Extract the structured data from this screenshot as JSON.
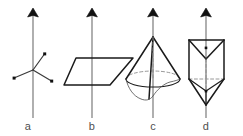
{
  "figure": {
    "width": 243,
    "height": 136,
    "background_color": "#ffffff",
    "axis_color": "#6e6e6e",
    "edge_color": "#1a1a1a",
    "hidden_edge_color": "#8c8c8c",
    "label_color": "#4f4f4f",
    "panels": [
      {
        "id": "a",
        "label": "a",
        "label_x": 28,
        "label_y": 130,
        "object": "trigonal-ligand-center",
        "description": "Vertical axis arrow through a central atom with three radiating bonds ending in dots",
        "axis": {
          "x": 33,
          "tip_y": 9,
          "base_y": 118
        },
        "center": {
          "x": 33,
          "y": 70
        },
        "ligands": [
          {
            "x": 44,
            "y": 54
          },
          {
            "x": 14,
            "y": 78
          },
          {
            "x": 51,
            "y": 81
          }
        ]
      },
      {
        "id": "b",
        "label": "b",
        "label_x": 92,
        "label_y": 130,
        "object": "plane-parallelogram",
        "description": "Vertical axis arrow passing perpendicular through a plane drawn as a parallelogram",
        "axis": {
          "x": 92,
          "tip_y": 9,
          "base_y": 118
        },
        "parallelogram": [
          {
            "x": 76,
            "y": 58
          },
          {
            "x": 133,
            "y": 58
          },
          {
            "x": 110,
            "y": 85
          },
          {
            "x": 64,
            "y": 85
          }
        ]
      },
      {
        "id": "c",
        "label": "c",
        "label_x": 153,
        "label_y": 130,
        "object": "cone",
        "description": "Vertical axis arrow through the apex and base centre of a cone with an irregular drooping rim",
        "axis": {
          "x": 153,
          "tip_y": 9,
          "base_y": 118
        },
        "apex": {
          "x": 153,
          "y": 37
        },
        "base_center": {
          "x": 153,
          "y": 79
        },
        "base_rx": 27,
        "base_ry": 8
      },
      {
        "id": "d",
        "label": "d",
        "label_x": 206,
        "label_y": 130,
        "object": "triangular-prism-bipyramid",
        "description": "Vertical axis arrow through a triangular prism capped with a downward pyramid",
        "axis": {
          "x": 206,
          "tip_y": 9,
          "base_y": 118
        },
        "top_left": {
          "x": 189,
          "y": 40
        },
        "top_right": {
          "x": 224,
          "y": 40
        },
        "front_apex_top": {
          "x": 206,
          "y": 59
        },
        "bottom_left": {
          "x": 189,
          "y": 79
        },
        "bottom_right": {
          "x": 224,
          "y": 79
        },
        "bottom_apex": {
          "x": 206,
          "y": 105
        },
        "dots": [
          {
            "x": 206,
            "y": 48
          },
          {
            "x": 206,
            "y": 91
          }
        ]
      }
    ]
  }
}
